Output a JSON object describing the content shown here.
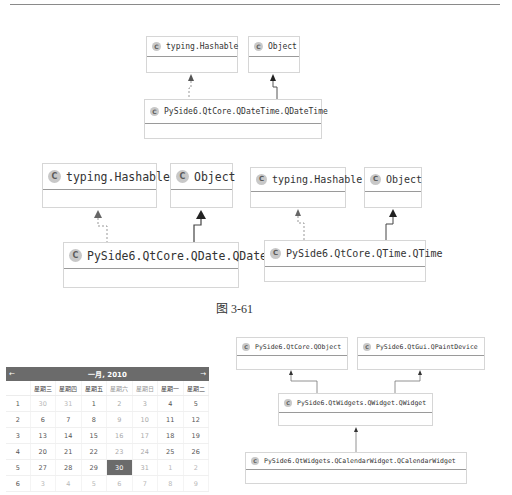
{
  "caption": "图 3-61",
  "class_icon": "C",
  "diagram_qdatetime": {
    "parents": [
      {
        "name": "typing.Hashable",
        "relation": "realization"
      },
      {
        "name": "Object",
        "relation": "generalization"
      }
    ],
    "child": {
      "name": "PySide6.QtCore.QDateTime.QDateTime"
    }
  },
  "diagram_qdate": {
    "parents": [
      {
        "name": "typing.Hashable",
        "relation": "realization"
      },
      {
        "name": "Object",
        "relation": "generalization"
      }
    ],
    "child": {
      "name": "PySide6.QtCore.QDate.QDate"
    }
  },
  "diagram_qtime": {
    "parents": [
      {
        "name": "typing.Hashable",
        "relation": "realization"
      },
      {
        "name": "Object",
        "relation": "generalization"
      }
    ],
    "child": {
      "name": "PySide6.QtCore.QTime.QTime"
    }
  },
  "diagram_qcalendarwidget": {
    "parents": [
      {
        "name": "PySide6.QtCore.QObject"
      },
      {
        "name": "PySide6.QtGui.QPaintDevice"
      }
    ],
    "middle": {
      "name": "PySide6.QtWidgets.QWidget.QWidget"
    },
    "child": {
      "name": "PySide6.QtWidgets.QCalendarWidget.QCalendarWidget"
    }
  },
  "calendar": {
    "prev_icon": "←",
    "next_icon": "→",
    "month": "一月,",
    "year": "2010",
    "weekdays": [
      "星期三",
      "星期四",
      "星期五",
      "星期六",
      "星期日",
      "星期一",
      "星期二"
    ],
    "weeks": [
      {
        "num": "1",
        "days": [
          "30",
          "31",
          "1",
          "2",
          "3",
          "4",
          "5"
        ]
      },
      {
        "num": "2",
        "days": [
          "6",
          "7",
          "8",
          "9",
          "10",
          "11",
          "12"
        ]
      },
      {
        "num": "3",
        "days": [
          "13",
          "14",
          "15",
          "16",
          "17",
          "18",
          "19"
        ]
      },
      {
        "num": "4",
        "days": [
          "20",
          "21",
          "22",
          "23",
          "24",
          "25",
          "26"
        ]
      },
      {
        "num": "5",
        "days": [
          "27",
          "28",
          "29",
          "30",
          "31",
          "1",
          "2"
        ]
      },
      {
        "num": "6",
        "days": [
          "3",
          "4",
          "5",
          "6",
          "7",
          "8",
          "9"
        ]
      }
    ],
    "selected": "30",
    "colors": {
      "header_bg": "#6b6b6b",
      "selected_bg": "#6b6b6b"
    }
  }
}
